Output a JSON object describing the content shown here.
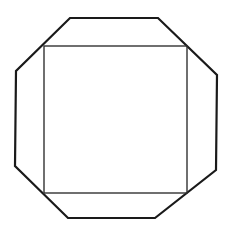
{
  "diagram": {
    "title": "",
    "colors": {
      "background": "#ffffff",
      "octagon_stroke": "#1a1a1a",
      "square_stroke": "#333333"
    },
    "octagon": {
      "points": "70,18 158,18 217,75 216,170 155,218 68,218 15,166 16,71",
      "stroke_width": 2.2
    },
    "square": {
      "x": 44,
      "y": 46,
      "width": 143,
      "height": 147,
      "stroke_width": 1.4
    }
  }
}
